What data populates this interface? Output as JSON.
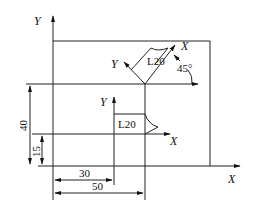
{
  "diagram": {
    "type": "coordinate-system-rotation-and-translation",
    "main_axes": {
      "x_label": "X",
      "y_label": "Y"
    },
    "translated_axes": {
      "x_label": "X",
      "y_label": "Y",
      "label": "L20"
    },
    "rotated_axes": {
      "x_label": "X",
      "y_label": "Y",
      "label": "L20",
      "angle": "45°"
    },
    "dimensions": {
      "horizontal_inner": "30",
      "horizontal_outer": "50",
      "vertical_inner": "15",
      "vertical_outer": "40"
    },
    "colors": {
      "line": "#222222",
      "background": "#ffffff"
    }
  }
}
